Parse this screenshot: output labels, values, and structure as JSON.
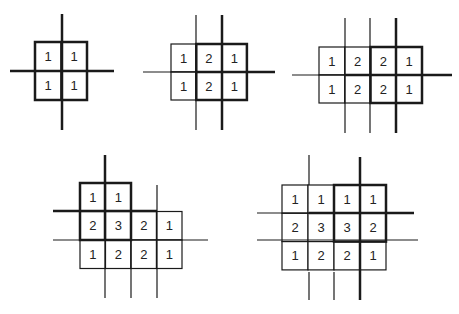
{
  "colors": {
    "line": "#1a1a1a",
    "text": "#222222",
    "background": "#ffffff"
  },
  "diagrams": [
    {
      "id": "d1",
      "origin": [
        35,
        42
      ],
      "cell": [
        26,
        29
      ],
      "grid": [
        [
          "1",
          "1"
        ],
        [
          "1",
          "1"
        ]
      ],
      "bold_box": {
        "col0": 0,
        "row0": 0,
        "cols": 2,
        "rows": 2
      },
      "lines": [
        {
          "x1": 62,
          "y1": 14,
          "x2": 62,
          "y2": 130,
          "w": 2.5
        },
        {
          "x1": 10,
          "y1": 71,
          "x2": 114,
          "y2": 71,
          "w": 2.5
        }
      ]
    },
    {
      "id": "d2",
      "origin": [
        171,
        44
      ],
      "cell": [
        25.3,
        28
      ],
      "grid": [
        [
          "1",
          "2",
          "1"
        ],
        [
          "1",
          "2",
          "1"
        ]
      ],
      "bold_box": {
        "col0": 1,
        "row0": 0,
        "cols": 2,
        "rows": 2
      },
      "lines": [
        {
          "x1": 196,
          "y1": 15,
          "x2": 196,
          "y2": 130,
          "w": 1.2
        },
        {
          "x1": 222,
          "y1": 15,
          "x2": 222,
          "y2": 130,
          "w": 2.5
        },
        {
          "x1": 143,
          "y1": 72,
          "x2": 196,
          "y2": 72,
          "w": 1.2
        },
        {
          "x1": 196,
          "y1": 72,
          "x2": 275,
          "y2": 72,
          "w": 2.5
        }
      ]
    },
    {
      "id": "d3",
      "origin": [
        319,
        47
      ],
      "cell": [
        25.75,
        28
      ],
      "grid": [
        [
          "1",
          "2",
          "2",
          "1"
        ],
        [
          "1",
          "2",
          "2",
          "1"
        ]
      ],
      "bold_box": {
        "col0": 2,
        "row0": 0,
        "cols": 2,
        "rows": 2
      },
      "lines": [
        {
          "x1": 345,
          "y1": 18,
          "x2": 345,
          "y2": 133,
          "w": 1.2
        },
        {
          "x1": 370,
          "y1": 18,
          "x2": 370,
          "y2": 133,
          "w": 1.2
        },
        {
          "x1": 396,
          "y1": 18,
          "x2": 396,
          "y2": 133,
          "w": 2.5
        },
        {
          "x1": 292,
          "y1": 75,
          "x2": 345,
          "y2": 75,
          "w": 1.2
        },
        {
          "x1": 345,
          "y1": 75,
          "x2": 452,
          "y2": 75,
          "w": 2.5
        }
      ]
    },
    {
      "id": "d4",
      "origin": [
        80,
        183
      ],
      "cell": [
        25.5,
        28.5
      ],
      "grid": [
        [
          "1",
          "1",
          "",
          ""
        ],
        [
          "2",
          "3",
          "2",
          "1"
        ],
        [
          "1",
          "2",
          "2",
          "1"
        ]
      ],
      "bold_box": {
        "col0": 0,
        "row0": 0,
        "cols": 2,
        "rows": 2
      },
      "lines": [
        {
          "x1": 105,
          "y1": 155,
          "x2": 105,
          "y2": 240,
          "w": 2.5
        },
        {
          "x1": 105,
          "y1": 240,
          "x2": 105,
          "y2": 298,
          "w": 1.2
        },
        {
          "x1": 131,
          "y1": 240,
          "x2": 131,
          "y2": 298,
          "w": 1.2
        },
        {
          "x1": 157,
          "y1": 185,
          "x2": 157,
          "y2": 298,
          "w": 1.2
        },
        {
          "x1": 53,
          "y1": 211,
          "x2": 157,
          "y2": 211,
          "w": 2.5
        },
        {
          "x1": 53,
          "y1": 240,
          "x2": 208,
          "y2": 240,
          "w": 1.2
        }
      ]
    },
    {
      "id": "d5",
      "origin": [
        282,
        185
      ],
      "cell": [
        26,
        28.3
      ],
      "grid": [
        [
          "1",
          "1",
          "1",
          "1"
        ],
        [
          "2",
          "3",
          "3",
          "2"
        ],
        [
          "1",
          "2",
          "2",
          "1"
        ]
      ],
      "bold_box": {
        "col0": 2,
        "row0": 0,
        "cols": 2,
        "rows": 2
      },
      "lines": [
        {
          "x1": 309,
          "y1": 155,
          "x2": 309,
          "y2": 185,
          "w": 1.2
        },
        {
          "x1": 309,
          "y1": 272,
          "x2": 309,
          "y2": 300,
          "w": 1.2
        },
        {
          "x1": 334,
          "y1": 272,
          "x2": 334,
          "y2": 300,
          "w": 1.2
        },
        {
          "x1": 360,
          "y1": 157,
          "x2": 360,
          "y2": 300,
          "w": 2.5
        },
        {
          "x1": 257,
          "y1": 213,
          "x2": 309,
          "y2": 213,
          "w": 1.2
        },
        {
          "x1": 309,
          "y1": 213,
          "x2": 414,
          "y2": 213,
          "w": 2.5
        },
        {
          "x1": 257,
          "y1": 240,
          "x2": 418,
          "y2": 240,
          "w": 1.2
        }
      ]
    }
  ]
}
